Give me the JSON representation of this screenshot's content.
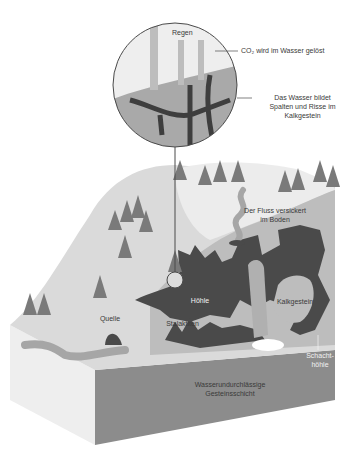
{
  "diagram": {
    "type": "cross-section illustration",
    "colors": {
      "background": "#ffffff",
      "snow_surface": "#e6e6e6",
      "hill_slope": "#d4d4d4",
      "limestone": "#b8b8b8",
      "cave_dark": "#4a4a4a",
      "impermeable_layer": "#8c8c8c",
      "water": "#a6a6a6",
      "tree": "#7a7a7a"
    },
    "inset": {
      "labels": {
        "rain": "Regen",
        "co2": "CO₂ wird im Wasser gelöst",
        "cracks_line1": "Das Wasser bildet",
        "cracks_line2": "Spalten und Risse im",
        "cracks_line3": "Kalkgestein"
      }
    },
    "labels": {
      "river_line1": "Der Fluss versickert",
      "river_line2": "im Boden",
      "spring": "Quelle",
      "cave": "Höhle",
      "stalactites": "Stalaktiten",
      "limestone": "Kalkgestein",
      "shaft_cave_line1": "Schacht-",
      "shaft_cave_line2": "höhle",
      "impermeable_line1": "Wasserundurchlässige",
      "impermeable_line2": "Gesteinsschicht"
    }
  }
}
